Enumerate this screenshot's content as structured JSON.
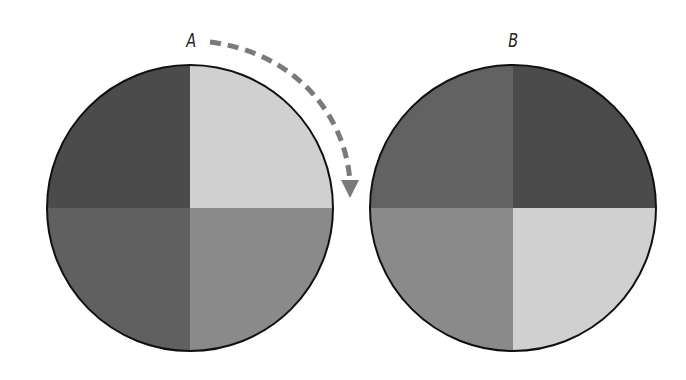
{
  "diagram": {
    "labels": {
      "a": "A",
      "b": "B"
    },
    "arrow": {
      "style": "dashed",
      "color": "#7a7a7a",
      "direction": "clockwise"
    },
    "outline_color": "#111111",
    "discs": [
      {
        "id": "A",
        "quadrants": {
          "top_left": "#4b4b4b",
          "top_right": "#d0d0d0",
          "bottom_left": "#606060",
          "bottom_right": "#8a8a8a"
        }
      },
      {
        "id": "B",
        "quadrants": {
          "top_left": "#626262",
          "top_right": "#4b4b4b",
          "bottom_left": "#8a8a8a",
          "bottom_right": "#d0d0d0"
        }
      }
    ]
  }
}
